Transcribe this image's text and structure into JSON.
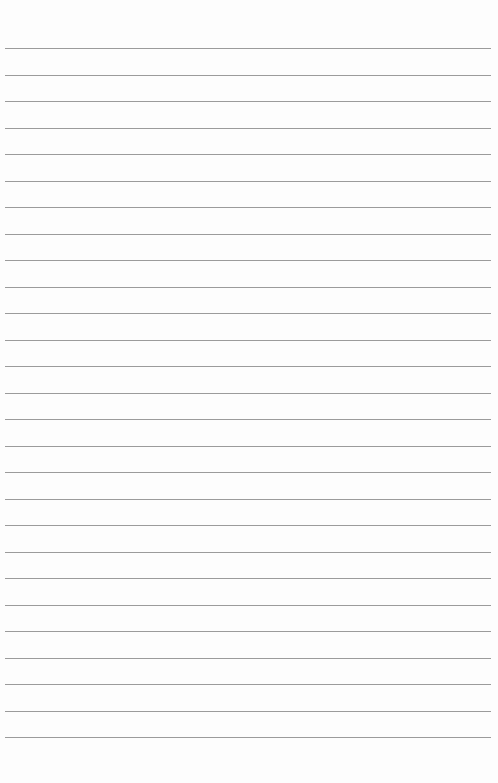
{
  "page": {
    "type": "ruled-paper",
    "background_color": "#fdfdfd",
    "line_color": "#8a8a8a",
    "line_count": 27,
    "first_line_y": 48,
    "line_spacing": 26.5,
    "line_left_x": 5,
    "line_width": 486
  }
}
